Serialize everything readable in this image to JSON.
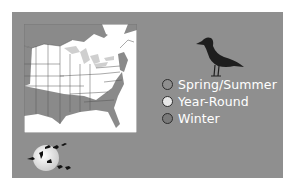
{
  "figure": {
    "background": "#8f8f8f",
    "map_region": "Eastern North America",
    "legend": {
      "items": [
        {
          "label": "Spring/Summer",
          "color": "#8f8f8f"
        },
        {
          "label": "Year-Round",
          "color": "#e8e8e8"
        },
        {
          "label": "Winter",
          "color": "#7a7a7a"
        }
      ]
    },
    "icons": {
      "bird": "gull-silhouette-icon",
      "moon": "moon-with-flying-birds-icon"
    }
  }
}
